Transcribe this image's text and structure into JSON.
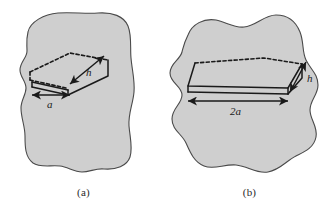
{
  "figure": {
    "background_color": "#ffffff",
    "blob_fill_color": "#cfcfcf",
    "blob_stroke_color": "#4a4a4a",
    "line_color": "#1a1a1a",
    "panels": [
      {
        "id": "a",
        "caption": "(a)",
        "blob_name": "irregular-surface-blob",
        "slab": {
          "name": "parallelogram-slab",
          "base_label": "a",
          "height_label": "h"
        },
        "dimensions": [
          {
            "name": "base-dimension",
            "label": "a",
            "axis": "horizontal"
          },
          {
            "name": "height-dimension",
            "label": "h",
            "axis": "diagonal"
          }
        ]
      },
      {
        "id": "b",
        "caption": "(b)",
        "blob_name": "irregular-surface-blob",
        "slab": {
          "name": "parallelogram-slab",
          "base_label": "2a",
          "height_label": "h"
        },
        "dimensions": [
          {
            "name": "base-dimension",
            "label": "2a",
            "axis": "horizontal"
          },
          {
            "name": "height-dimension",
            "label": "h",
            "axis": "diagonal"
          }
        ]
      }
    ]
  }
}
